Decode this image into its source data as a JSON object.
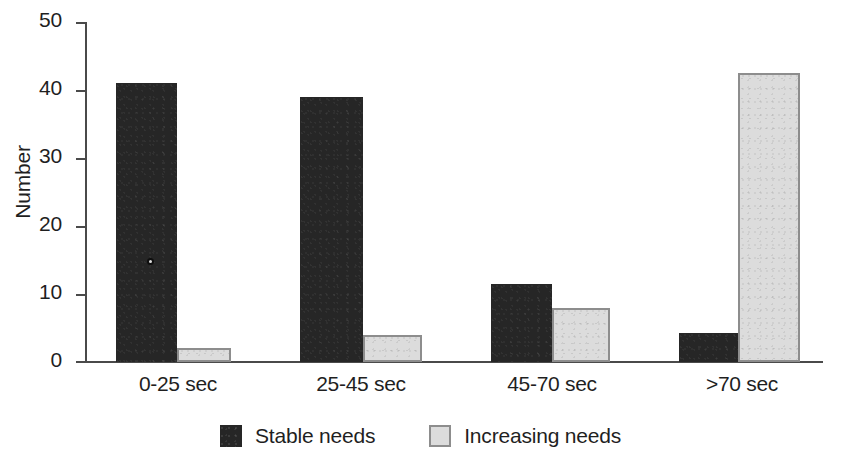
{
  "chart_data": {
    "type": "bar",
    "title": "",
    "xlabel": "",
    "ylabel": "Number",
    "ylim": [
      0,
      50
    ],
    "yticks": [
      0,
      10,
      20,
      30,
      40,
      50
    ],
    "grid": false,
    "legend_position": "bottom-center",
    "categories": [
      "0-25 sec",
      "25-45 sec",
      "45-70 sec",
      ">70 sec"
    ],
    "series": [
      {
        "name": "Stable needs",
        "color": "#262626",
        "values": [
          41,
          39,
          11.5,
          4.3
        ]
      },
      {
        "name": "Increasing needs",
        "color": "#dcdcdc",
        "values": [
          2,
          4,
          8,
          42.5
        ]
      }
    ]
  },
  "axis": {
    "y_tick_labels": [
      "50",
      "40",
      "30",
      "20",
      "10",
      "0"
    ],
    "y_axis_title": "Number"
  },
  "categories": {
    "c0": "0-25 sec",
    "c1": "25-45 sec",
    "c2": "45-70 sec",
    "c3": ">70 sec"
  },
  "legend": {
    "items": [
      {
        "label": "Stable needs",
        "swatch": "dark-square-swatch"
      },
      {
        "label": "Increasing needs",
        "swatch": "light-square-swatch"
      }
    ]
  }
}
